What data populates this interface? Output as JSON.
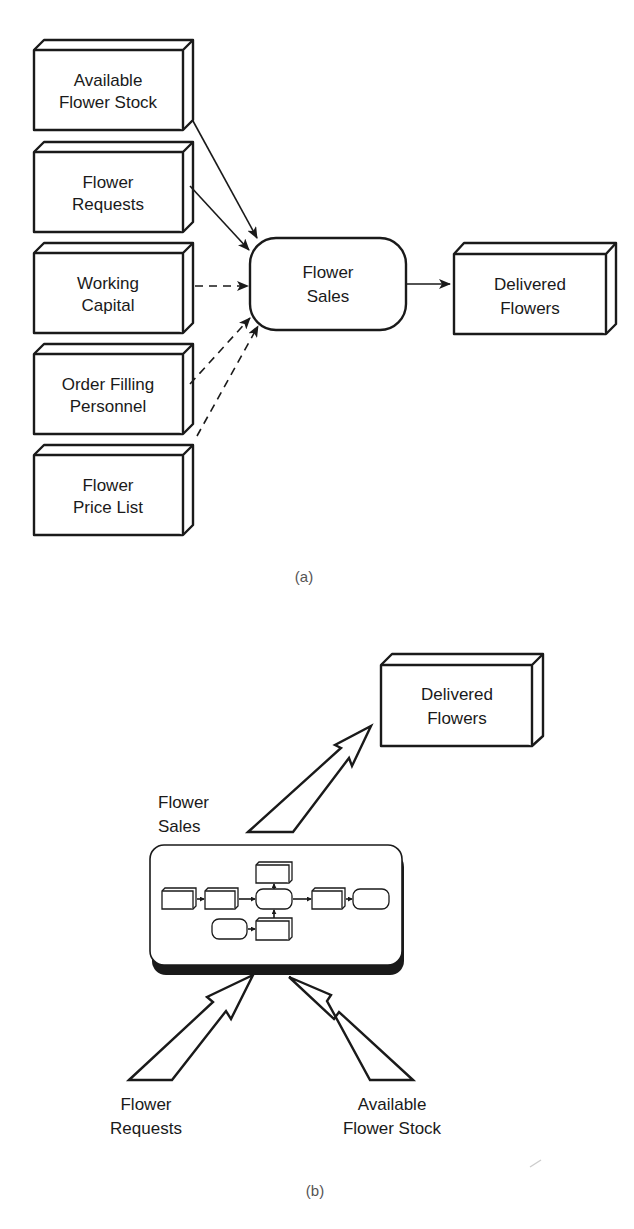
{
  "diagram_a": {
    "caption": "(a)",
    "inputs": [
      {
        "line1": "Available",
        "line2": "Flower Stock",
        "flow": "solid"
      },
      {
        "line1": "Flower",
        "line2": "Requests",
        "flow": "solid"
      },
      {
        "line1": "Working",
        "line2": "Capital",
        "flow": "dashed"
      },
      {
        "line1": "Order Filling",
        "line2": "Personnel",
        "flow": "dashed"
      },
      {
        "line1": "Flower",
        "line2": "Price List",
        "flow": "dashed"
      }
    ],
    "process": {
      "line1": "Flower",
      "line2": "Sales"
    },
    "output": {
      "line1": "Delivered",
      "line2": "Flowers"
    }
  },
  "diagram_b": {
    "caption": "(b)",
    "process_label": {
      "line1": "Flower",
      "line2": "Sales"
    },
    "output": {
      "line1": "Delivered",
      "line2": "Flowers"
    },
    "inputs": [
      {
        "line1": "Flower",
        "line2": "Requests"
      },
      {
        "line1": "Available",
        "line2": "Flower Stock"
      }
    ]
  },
  "colors": {
    "ink": "#1a1a1a",
    "caption": "#555555",
    "background": "#ffffff"
  }
}
